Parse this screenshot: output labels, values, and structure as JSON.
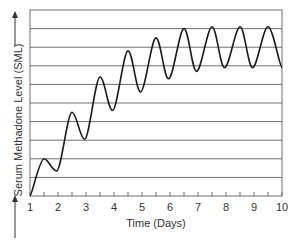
{
  "chart_data": {
    "type": "line",
    "title": "",
    "xlabel": "Time (Days)",
    "ylabel": "Serum Methadone Level (SML)",
    "xlim": [
      1,
      10
    ],
    "ylim": [
      0,
      10
    ],
    "x_ticks": [
      "1",
      "2",
      "3",
      "4",
      "5",
      "6",
      "7",
      "8",
      "9",
      "10"
    ],
    "y_ticks": [],
    "grid": {
      "horizontal": true,
      "vertical": false,
      "count": 10
    },
    "legend": null,
    "series": [
      {
        "name": "Serum methadone level",
        "color": "#1a1a1a",
        "points": [
          [
            1.0,
            0.0
          ],
          [
            1.5,
            2.0
          ],
          [
            1.95,
            1.35
          ],
          [
            2.5,
            4.5
          ],
          [
            2.95,
            3.05
          ],
          [
            3.5,
            6.4
          ],
          [
            3.95,
            4.6
          ],
          [
            4.5,
            7.8
          ],
          [
            4.95,
            5.6
          ],
          [
            5.5,
            8.5
          ],
          [
            5.95,
            6.3
          ],
          [
            6.5,
            9.0
          ],
          [
            6.95,
            6.7
          ],
          [
            7.5,
            9.1
          ],
          [
            7.95,
            6.9
          ],
          [
            8.5,
            9.1
          ],
          [
            8.95,
            6.9
          ],
          [
            9.5,
            9.1
          ],
          [
            10.0,
            6.9
          ]
        ]
      }
    ],
    "annotations": [
      "up-arrow at top of y-axis label",
      "up-arrow at bottom of y-axis label"
    ]
  },
  "colors": {
    "grid": "#6e6e6e",
    "frame": "#6e6e6e",
    "line": "#1a1a1a",
    "text": "#333333"
  }
}
